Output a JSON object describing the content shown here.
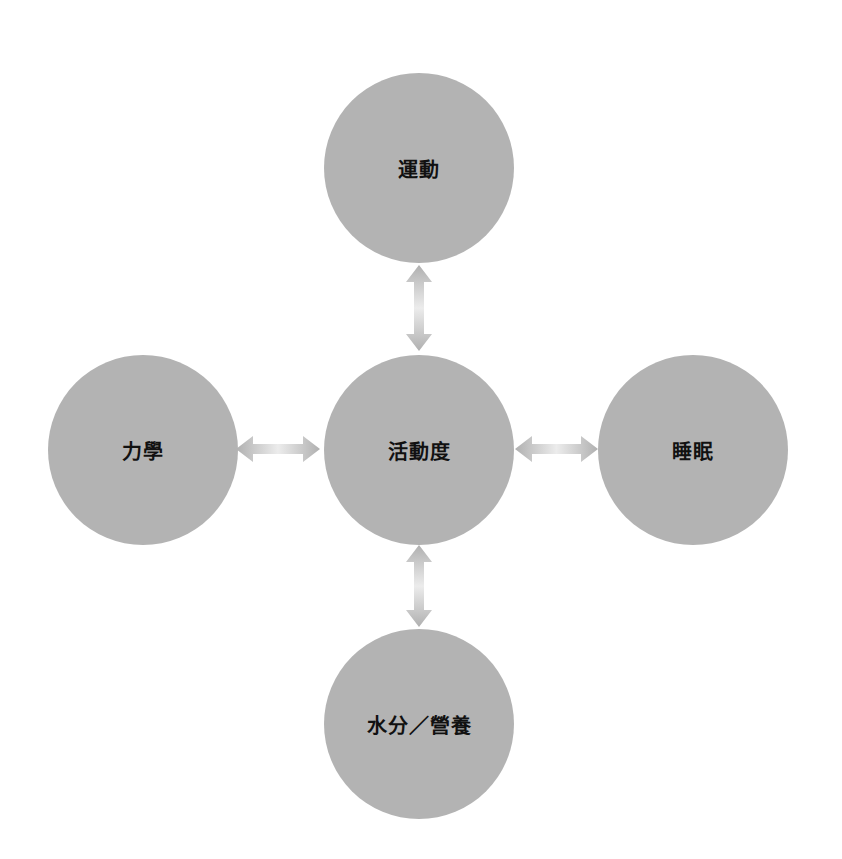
{
  "diagram": {
    "type": "hub-and-spoke",
    "colors": {
      "background": "#ffffff",
      "node_fill": "#b3b3b3",
      "label_color": "#111111",
      "arrow_end": "#b0b0b0",
      "arrow_mid": "#ececec"
    },
    "center": {
      "label": "活動度"
    },
    "nodes": {
      "top": {
        "label": "運動"
      },
      "left": {
        "label": "力學"
      },
      "right": {
        "label": "睡眠"
      },
      "bottom": {
        "label": "水分／營養"
      }
    },
    "connections": [
      {
        "from": "center",
        "to": "top",
        "style": "double-arrow"
      },
      {
        "from": "center",
        "to": "left",
        "style": "double-arrow"
      },
      {
        "from": "center",
        "to": "right",
        "style": "double-arrow"
      },
      {
        "from": "center",
        "to": "bottom",
        "style": "double-arrow"
      }
    ]
  }
}
